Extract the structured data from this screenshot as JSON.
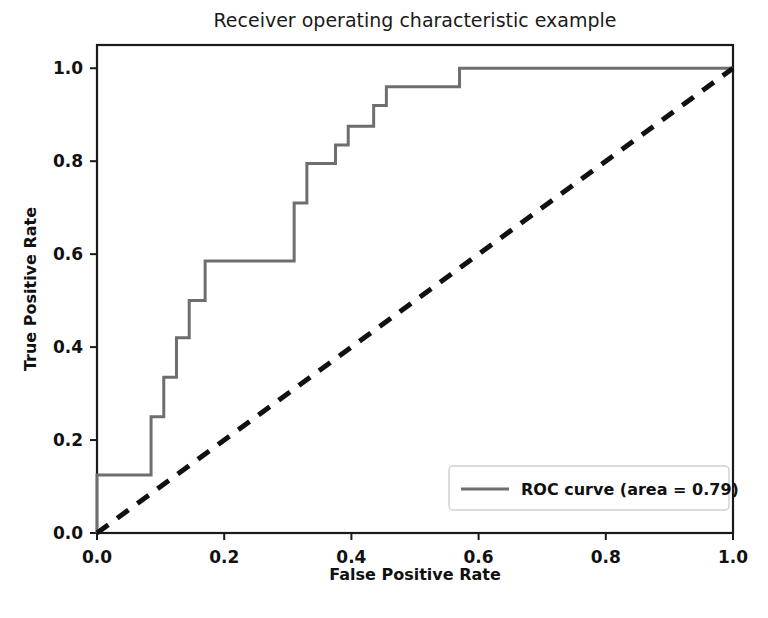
{
  "chart_data": {
    "type": "line",
    "title": "Receiver operating characteristic example",
    "xlabel": "False Positive Rate",
    "ylabel": "True Positive Rate",
    "xlim": [
      0.0,
      1.0
    ],
    "ylim": [
      0.0,
      1.05
    ],
    "grid": false,
    "legend_position": "lower right",
    "xticks": [
      "0.0",
      "0.2",
      "0.4",
      "0.6",
      "0.8",
      "1.0"
    ],
    "xtick_values": [
      0.0,
      0.2,
      0.4,
      0.6,
      0.8,
      1.0
    ],
    "yticks": [
      "0.0",
      "0.2",
      "0.4",
      "0.6",
      "0.8",
      "1.0"
    ],
    "ytick_values": [
      0.0,
      0.2,
      0.4,
      0.6,
      0.8,
      1.0
    ],
    "area": 0.79,
    "series": [
      {
        "name": "ROC curve (area = 0.79)",
        "style": "solid",
        "color": "#6e6e6e",
        "drawstyle": "steps-post",
        "x": [
          0.0,
          0.0,
          0.085,
          0.085,
          0.105,
          0.105,
          0.125,
          0.125,
          0.145,
          0.145,
          0.17,
          0.17,
          0.31,
          0.31,
          0.33,
          0.33,
          0.375,
          0.375,
          0.395,
          0.395,
          0.435,
          0.435,
          0.455,
          0.455,
          0.57,
          0.57,
          1.0
        ],
        "y": [
          0.0,
          0.125,
          0.125,
          0.25,
          0.25,
          0.335,
          0.335,
          0.42,
          0.42,
          0.5,
          0.5,
          0.585,
          0.585,
          0.71,
          0.71,
          0.795,
          0.795,
          0.835,
          0.835,
          0.875,
          0.875,
          0.92,
          0.92,
          0.96,
          0.96,
          1.0,
          1.0
        ]
      },
      {
        "name": "chance",
        "style": "dashed",
        "color": "#111111",
        "drawstyle": "default",
        "x": [
          0.0,
          1.0
        ],
        "y": [
          0.0,
          1.0
        ]
      }
    ],
    "legend_entries": [
      {
        "label": "ROC curve (area = 0.79)",
        "color": "#6e6e6e",
        "style": "solid"
      }
    ]
  },
  "axes_geometry": {
    "left": 97,
    "right": 733,
    "top": 45,
    "bottom": 533
  }
}
